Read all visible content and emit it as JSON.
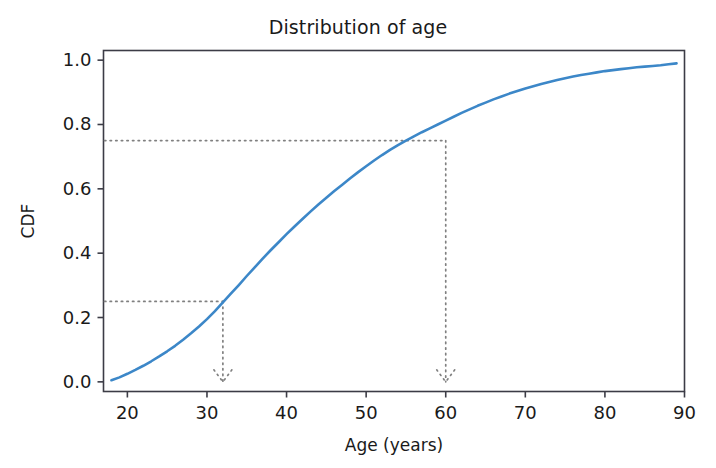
{
  "chart_data": {
    "type": "line",
    "title": "Distribution of age",
    "xlabel": "Age (years)",
    "ylabel": "CDF",
    "xlim": [
      17.0,
      90.0
    ],
    "ylim": [
      -0.03,
      1.03
    ],
    "grid": false,
    "legend": "none",
    "xticks": [
      20,
      30,
      40,
      50,
      60,
      70,
      80,
      90
    ],
    "xtick_labels": [
      "20",
      "30",
      "40",
      "50",
      "60",
      "70",
      "80",
      "90"
    ],
    "yticks": [
      0.0,
      0.2,
      0.4,
      0.6,
      0.8,
      1.0
    ],
    "ytick_labels": [
      "0.0",
      "0.2",
      "0.4",
      "0.6",
      "0.8",
      "1.0"
    ],
    "series": [
      {
        "name": "CDF of age",
        "color": "#3c87c8",
        "linewidth": 2.6,
        "x": [
          18,
          19,
          20,
          21,
          22,
          23,
          24,
          25,
          26,
          27,
          28,
          29,
          30,
          31,
          32,
          33,
          34,
          35,
          36,
          37,
          38,
          39,
          40,
          41,
          42,
          43,
          44,
          45,
          46,
          47,
          48,
          49,
          50,
          51,
          52,
          53,
          54,
          55,
          56,
          57,
          58,
          59,
          60,
          61,
          62,
          63,
          64,
          65,
          66,
          67,
          68,
          69,
          70,
          71,
          72,
          73,
          74,
          75,
          76,
          77,
          78,
          79,
          80,
          81,
          82,
          83,
          84,
          85,
          86,
          87,
          88,
          89
        ],
        "y": [
          0.005,
          0.014,
          0.025,
          0.037,
          0.05,
          0.064,
          0.079,
          0.095,
          0.112,
          0.131,
          0.151,
          0.172,
          0.195,
          0.22,
          0.247,
          0.274,
          0.301,
          0.329,
          0.356,
          0.383,
          0.409,
          0.434,
          0.459,
          0.483,
          0.506,
          0.529,
          0.551,
          0.572,
          0.593,
          0.613,
          0.633,
          0.652,
          0.67,
          0.688,
          0.705,
          0.721,
          0.736,
          0.75,
          0.763,
          0.776,
          0.788,
          0.8,
          0.812,
          0.824,
          0.836,
          0.847,
          0.858,
          0.868,
          0.878,
          0.887,
          0.896,
          0.904,
          0.912,
          0.919,
          0.926,
          0.932,
          0.938,
          0.944,
          0.949,
          0.954,
          0.958,
          0.962,
          0.966,
          0.969,
          0.972,
          0.975,
          0.978,
          0.98,
          0.982,
          0.984,
          0.987,
          0.99
        ]
      }
    ],
    "annotations": [
      {
        "name": "first-quartile-guide",
        "cdf": 0.25,
        "age": 32.0,
        "style": "dotted",
        "color": "#808080",
        "arrow": "down"
      },
      {
        "name": "third-quartile-guide",
        "cdf": 0.75,
        "age": 60.0,
        "style": "dotted",
        "color": "#808080",
        "arrow": "down"
      }
    ]
  },
  "figure": {
    "title": "Distribution of age",
    "xlabel": "Age (years)",
    "ylabel": "CDF"
  },
  "colors": {
    "line": "#3c87c8",
    "annotation": "#808080",
    "axis": "#3c3c46",
    "text": "#1a1a1a",
    "background": "#ffffff"
  }
}
